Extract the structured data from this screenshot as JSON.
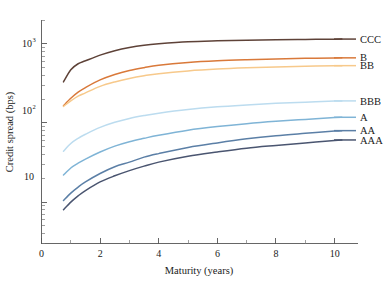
{
  "chart_data": {
    "type": "line",
    "title": "",
    "xlabel": "Maturity (years)",
    "ylabel": "Credit spread (bps)",
    "xlim": [
      0,
      10.8
    ],
    "ylim": [
      3,
      2000
    ],
    "yscale": "log",
    "xscale": "linear",
    "grid": false,
    "legend_position": "right-outside",
    "xticks": [
      "0",
      "2",
      "4",
      "6",
      "8",
      "10"
    ],
    "xtick_values": [
      0,
      2,
      4,
      6,
      8,
      10
    ],
    "ytick_labels": [
      "10",
      "10²",
      "10³"
    ],
    "ytick_values": [
      10,
      100,
      1000
    ],
    "x": [
      0.75,
      1,
      1.25,
      1.5,
      2,
      2.5,
      3,
      3.5,
      4,
      5,
      6,
      7,
      8,
      9,
      10,
      10.25
    ],
    "series": [
      {
        "name": "CCC",
        "label": "CCC",
        "color": "#5e4238",
        "values": [
          330,
          470,
          560,
          610,
          720,
          820,
          900,
          960,
          1000,
          1060,
          1090,
          1110,
          1125,
          1135,
          1145,
          1148
        ]
      },
      {
        "name": "B",
        "label": "B",
        "color": "#d9793a",
        "values": [
          165,
          205,
          245,
          280,
          350,
          410,
          460,
          500,
          535,
          580,
          610,
          630,
          645,
          655,
          662,
          665
        ]
      },
      {
        "name": "BB",
        "label": "BB",
        "color": "#f7c98b",
        "values": [
          162,
          190,
          218,
          240,
          290,
          330,
          365,
          395,
          420,
          455,
          480,
          497,
          510,
          520,
          527,
          530
        ]
      },
      {
        "name": "BBB",
        "label": "BBB",
        "color": "#bcdcef",
        "values": [
          44,
          55,
          64,
          72,
          88,
          102,
          114,
          124,
          133,
          148,
          160,
          169,
          177,
          183,
          189,
          190
        ]
      },
      {
        "name": "A",
        "label": "A",
        "color": "#7fb4d6",
        "values": [
          22,
          27,
          31,
          35,
          43,
          51,
          58,
          64,
          70,
          81,
          90,
          98,
          105,
          111,
          117,
          118
        ]
      },
      {
        "name": "AA",
        "label": "AA",
        "color": "#5b7fa6",
        "values": [
          10.5,
          13,
          15.5,
          18,
          23,
          28,
          32,
          37,
          41,
          49,
          56,
          63,
          69,
          74,
          79,
          80
        ]
      },
      {
        "name": "AAA",
        "label": "AAA",
        "color": "#4a5570",
        "values": [
          8.0,
          10,
          12,
          14,
          18,
          21.5,
          25,
          28.5,
          32,
          38,
          43,
          48,
          52,
          56,
          60,
          61
        ]
      }
    ],
    "legend_entries": [
      {
        "label": "CCC",
        "color": "#5e4238"
      },
      {
        "label": "B",
        "color": "#d9793a"
      },
      {
        "label": "BB",
        "color": "#f7c98b"
      },
      {
        "label": "BBB",
        "color": "#bcdcef"
      },
      {
        "label": "A",
        "color": "#7fb4d6"
      },
      {
        "label": "AA",
        "color": "#5b7fa6"
      },
      {
        "label": "AAA",
        "color": "#4a5570"
      }
    ]
  },
  "axes": {
    "x_title": "Maturity (years)",
    "y_title": "Credit spread (bps)",
    "y_tick_1": "10",
    "y_tick_2": "10",
    "y_tick_2_exp": "2",
    "y_tick_3": "10",
    "y_tick_3_exp": "3",
    "x_tick_0": "0",
    "x_tick_2": "2",
    "x_tick_4": "4",
    "x_tick_6": "6",
    "x_tick_8": "8",
    "x_tick_10": "10"
  },
  "legend": {
    "item_0": "CCC",
    "item_1": "B",
    "item_2": "BB",
    "item_3": "BBB",
    "item_4": "A",
    "item_5": "AA",
    "item_6": "AAA"
  }
}
